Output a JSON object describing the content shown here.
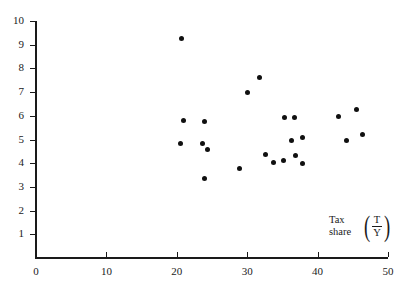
{
  "chart_data": {
    "type": "scatter",
    "title": "",
    "subtitle": "",
    "xlabel": "",
    "ylabel": "",
    "xlim": [
      0,
      50
    ],
    "ylim": [
      0,
      10
    ],
    "grid": false,
    "legend": null,
    "x_ticks": [
      0,
      10,
      20,
      30,
      40,
      50
    ],
    "y_ticks": [
      1,
      2,
      3,
      4,
      5,
      6,
      7,
      8,
      9,
      10
    ],
    "x_tick_labels": [
      "0",
      "10",
      "20",
      "30",
      "40",
      "50"
    ],
    "y_tick_labels": [
      "1",
      "2",
      "3",
      "4",
      "5",
      "6",
      "7",
      "8",
      "9",
      "10"
    ],
    "marker": "filled-circle",
    "marker_color": "#101010",
    "axis_color": "#1a1a1a",
    "background": "#ffffff",
    "annotations": [
      {
        "name": "tax-share-label",
        "text": "Tax\nshare",
        "numerator": "T",
        "denominator": "Y",
        "x": 37.5,
        "y": 1.6
      }
    ],
    "points": [
      {
        "x": 20.7,
        "y": 9.25
      },
      {
        "x": 31.8,
        "y": 7.62
      },
      {
        "x": 30.0,
        "y": 6.97
      },
      {
        "x": 45.5,
        "y": 6.25
      },
      {
        "x": 35.3,
        "y": 5.92
      },
      {
        "x": 36.7,
        "y": 5.94
      },
      {
        "x": 43.0,
        "y": 5.95
      },
      {
        "x": 20.9,
        "y": 5.8
      },
      {
        "x": 23.9,
        "y": 5.77
      },
      {
        "x": 46.4,
        "y": 5.21
      },
      {
        "x": 37.9,
        "y": 5.07
      },
      {
        "x": 36.3,
        "y": 4.95
      },
      {
        "x": 44.1,
        "y": 4.94
      },
      {
        "x": 23.7,
        "y": 4.85
      },
      {
        "x": 20.5,
        "y": 4.83
      },
      {
        "x": 24.4,
        "y": 4.57
      },
      {
        "x": 32.6,
        "y": 4.38
      },
      {
        "x": 36.8,
        "y": 4.31
      },
      {
        "x": 35.2,
        "y": 4.11
      },
      {
        "x": 33.7,
        "y": 4.04
      },
      {
        "x": 37.9,
        "y": 3.97
      },
      {
        "x": 28.9,
        "y": 3.78
      },
      {
        "x": 23.9,
        "y": 3.34
      }
    ]
  }
}
